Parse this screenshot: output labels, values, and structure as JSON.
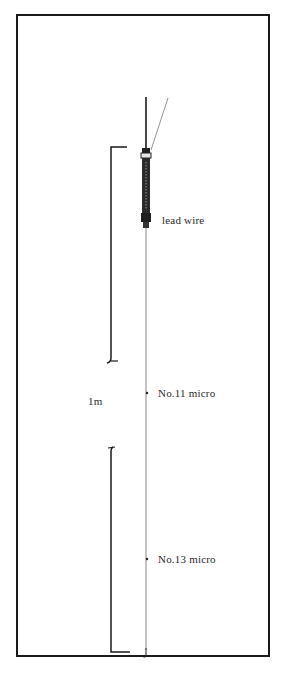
{
  "diagram": {
    "labels": {
      "lead_wire": "lead wire",
      "upper_line": "No.11 micro",
      "lower_line": "No.13 micro",
      "length": "1m"
    },
    "colors": {
      "line": "#1a1a1a",
      "float_body": "#2b2b2b",
      "background": "#ffffff"
    }
  }
}
